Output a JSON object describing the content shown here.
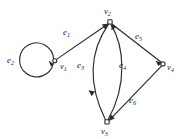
{
  "figure": {
    "kind": "directed-multigraph",
    "background_color": "#ffffff",
    "ink_color": "#2b2b2b",
    "width": 178,
    "height": 139
  },
  "vertices": [
    {
      "id": "v1",
      "name": "v",
      "sub": "1",
      "x": 55,
      "y": 61,
      "label_x": 60,
      "label_y": 62
    },
    {
      "id": "v2",
      "name": "v",
      "sub": "2",
      "x": 110,
      "y": 22,
      "label_x": 104,
      "label_y": 7
    },
    {
      "id": "v3",
      "name": "v",
      "sub": "3",
      "x": 107,
      "y": 122,
      "label_x": 101,
      "label_y": 127
    },
    {
      "id": "v4",
      "name": "v",
      "sub": "4",
      "x": 163,
      "y": 64,
      "label_x": 167,
      "label_y": 63
    }
  ],
  "edges": [
    {
      "id": "e1",
      "name": "e",
      "sub": "1",
      "from": "v1",
      "to": "v2",
      "shape": "straight",
      "label_x": 63,
      "label_y": 28
    },
    {
      "id": "e2",
      "name": "e",
      "sub": "2",
      "from": "v1",
      "to": "v1",
      "shape": "loop",
      "label_x": 7,
      "label_y": 56
    },
    {
      "id": "e3",
      "name": "e",
      "sub": "3",
      "from": "v2",
      "to": "v3",
      "shape": "curve-left",
      "label_x": 77,
      "label_y": 61
    },
    {
      "id": "e4",
      "name": "e",
      "sub": "4",
      "from": "v3",
      "to": "v2",
      "shape": "curve-right",
      "label_x": 119,
      "label_y": 61
    },
    {
      "id": "e5",
      "name": "e",
      "sub": "5",
      "from": "v2",
      "to": "v4",
      "shape": "straight",
      "label_x": 135,
      "label_y": 32
    },
    {
      "id": "e6",
      "name": "e",
      "sub": "6",
      "from": "v4",
      "to": "v3",
      "shape": "straight",
      "label_x": 129,
      "label_y": 96
    }
  ],
  "geometry": {
    "loop": {
      "cx": 40,
      "cy": 61,
      "r": 17
    },
    "vertex_radius": 2.4
  }
}
